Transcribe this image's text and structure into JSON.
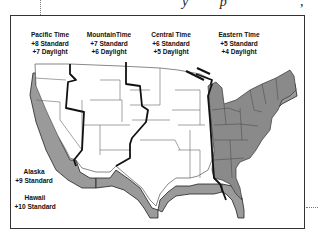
{
  "header": {
    "partial_text": "y  p",
    "partial_comma": ","
  },
  "zones": [
    {
      "name": "Pacific Time",
      "standard": "+8 Standard",
      "daylight": "+7 Daylight"
    },
    {
      "name": "MountainTime",
      "standard": "+7 Standard",
      "daylight": "+6 Daylight"
    },
    {
      "name": "Central Time",
      "standard": "+6 Standard",
      "daylight": "+5 Daylight"
    },
    {
      "name": "Eastern Time",
      "standard": "+5 Standard",
      "daylight": "+4 Daylight"
    }
  ],
  "other_zones": [
    {
      "name": "Alaska",
      "standard": "+9 Standard"
    },
    {
      "name": "Hawaii",
      "standard": "+10 Standard"
    }
  ],
  "colors": {
    "eastern_fill": "#8a8a8a",
    "relief_fill": "#9a9a9a",
    "border": "#111111"
  }
}
